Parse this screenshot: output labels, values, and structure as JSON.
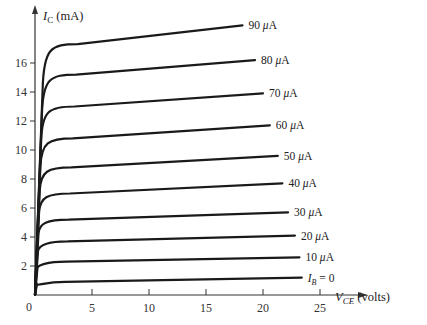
{
  "chart_data": {
    "type": "line",
    "title": "",
    "xlabel": "V_CE (volts)",
    "ylabel": "I_C (mA)",
    "xlabel_parts": {
      "symbol": "V",
      "sub": "CE",
      "unit": " (volts)"
    },
    "ylabel_parts": {
      "symbol": "I",
      "sub": "C",
      "unit": " (mA)"
    },
    "xlim": [
      0,
      27
    ],
    "ylim": [
      0,
      19
    ],
    "x_ticks": [
      0,
      5,
      10,
      15,
      20,
      25
    ],
    "y_ticks": [
      2,
      4,
      6,
      8,
      10,
      12,
      14,
      16
    ],
    "grid": false,
    "legend": "inline labels at right end of each curve",
    "series": [
      {
        "name": "90 μA",
        "label": "90 μA",
        "knee_ic": 17.3,
        "end_vce": 18.2,
        "end_ic": 18.6
      },
      {
        "name": "80 μA",
        "label": "80 μA",
        "knee_ic": 15.2,
        "end_vce": 19.3,
        "end_ic": 16.2
      },
      {
        "name": "70 μA",
        "label": "70 μA",
        "knee_ic": 13.0,
        "end_vce": 20.0,
        "end_ic": 13.9
      },
      {
        "name": "60 μA",
        "label": "60 μA",
        "knee_ic": 10.8,
        "end_vce": 20.6,
        "end_ic": 11.7
      },
      {
        "name": "50 μA",
        "label": "50 μA",
        "knee_ic": 8.8,
        "end_vce": 21.3,
        "end_ic": 9.6
      },
      {
        "name": "40 μA",
        "label": "40 μA",
        "knee_ic": 7.0,
        "end_vce": 21.7,
        "end_ic": 7.7
      },
      {
        "name": "30 μA",
        "label": "30 μA",
        "knee_ic": 5.2,
        "end_vce": 22.2,
        "end_ic": 5.7
      },
      {
        "name": "20 μA",
        "label": "20 μA",
        "knee_ic": 3.7,
        "end_vce": 22.8,
        "end_ic": 4.1
      },
      {
        "name": "10 μA",
        "label": "10 μA",
        "knee_ic": 2.3,
        "end_vce": 23.2,
        "end_ic": 2.6
      },
      {
        "name": "I_B = 0",
        "label": "I_B = 0",
        "knee_ic": 0.9,
        "end_vce": 23.4,
        "end_ic": 1.2
      }
    ]
  },
  "labels": {
    "y_axis": {
      "symbol": "I",
      "sub": "C",
      "unit": " (mA)"
    },
    "x_axis": {
      "symbol": "V",
      "sub": "CE",
      "unit": " (volts)"
    },
    "origin": "0",
    "ib_zero": {
      "symbol": "I",
      "sub": "B",
      "rest": " = 0"
    }
  },
  "colors": {
    "line": "#1a1a1a",
    "axis": "#333333",
    "background": "#ffffff"
  }
}
